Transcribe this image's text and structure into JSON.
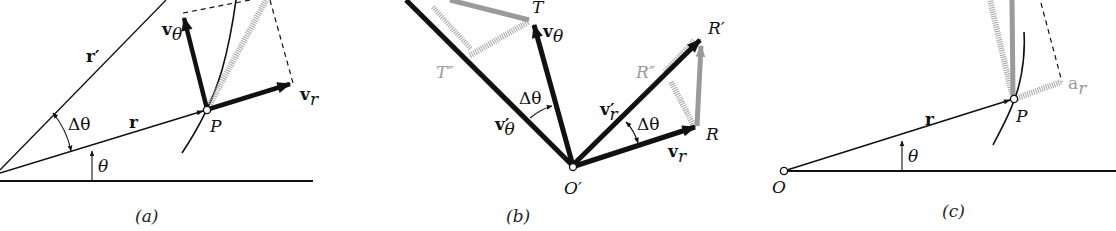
{
  "figure": {
    "colors": {
      "ink": "#111111",
      "gray_vector": "#9a9a9a",
      "hatch": "#a8a8a8",
      "background": "#ffffff"
    },
    "panels": [
      {
        "id": "a",
        "caption": "(a)",
        "labels": {
          "r_prime": "r′",
          "r": "r",
          "delta_theta": "Δθ",
          "theta": "θ",
          "point": "P",
          "v_theta": "v",
          "v_theta_sub": "θ",
          "v_r": "v",
          "v_r_sub": "r"
        }
      },
      {
        "id": "b",
        "caption": "(b)",
        "labels": {
          "T": "T",
          "T_double_prime": "T″",
          "v_theta": "v",
          "v_theta_sub": "θ",
          "v_theta_prime": "v′",
          "v_theta_prime_sub": "θ",
          "delta_theta_left": "Δθ",
          "origin": "O′",
          "R_prime": "R′",
          "R_double_prime": "R″",
          "v_r_prime": "v′",
          "v_r_prime_sub": "r",
          "delta_theta_right": "Δθ",
          "R": "R",
          "v_r": "v",
          "v_r_sub": "r"
        }
      },
      {
        "id": "c",
        "caption": "(c)",
        "labels": {
          "r": "r",
          "theta": "θ",
          "point": "P",
          "origin": "O",
          "a_r": "a",
          "a_r_sub": "r"
        }
      }
    ]
  }
}
